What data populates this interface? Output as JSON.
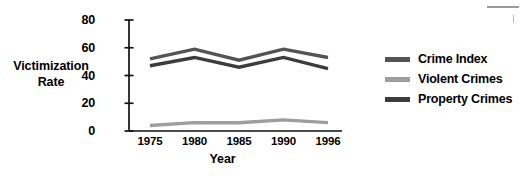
{
  "chart_data": {
    "type": "line",
    "title": "",
    "xlabel": "Year",
    "ylabel": "Victimization Rate",
    "categories": [
      "1975",
      "1980",
      "1985",
      "1990",
      "1996"
    ],
    "x": [
      1975,
      1980,
      1985,
      1990,
      1996
    ],
    "ylim": [
      0,
      80
    ],
    "yticks": [
      0,
      20,
      40,
      60,
      80
    ],
    "grid": false,
    "legend_position": "right",
    "series": [
      {
        "name": "Crime Index",
        "color": "#545454",
        "values": [
          52,
          59,
          51,
          59,
          53
        ]
      },
      {
        "name": "Violent Crimes",
        "color": "#9e9e9e",
        "values": [
          4,
          6,
          6,
          8,
          6
        ]
      },
      {
        "name": "Property Crimes",
        "color": "#3c3c3c",
        "values": [
          47,
          53,
          46,
          53,
          45
        ]
      }
    ]
  },
  "axes": {
    "y_title_line1": "Victimization",
    "y_title_line2": "Rate",
    "x_title": "Year",
    "y_tick_labels": [
      "0",
      "20",
      "40",
      "60",
      "80"
    ],
    "x_tick_labels": [
      "1975",
      "1980",
      "1985",
      "1990",
      "1996"
    ]
  },
  "legend": {
    "items": [
      {
        "label": "Crime Index",
        "color": "#545454"
      },
      {
        "label": "Violent Crimes",
        "color": "#9e9e9e"
      },
      {
        "label": "Property Crimes",
        "color": "#3c3c3c"
      }
    ]
  }
}
